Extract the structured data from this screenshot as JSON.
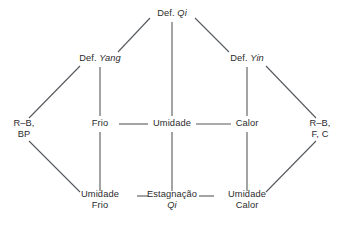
{
  "diagram": {
    "colors": {
      "line": "#55585c",
      "text": "#2b2b2d",
      "background": "#ffffff"
    },
    "nodes": [
      {
        "id": "def-qi",
        "line1_plain": "Def. ",
        "line1_italic": "Qi",
        "line2_plain": "",
        "line2_italic": "",
        "x": 172,
        "y": 14
      },
      {
        "id": "def-yang",
        "line1_plain": "Def. ",
        "line1_italic": "Yang",
        "line2_plain": "",
        "line2_italic": "",
        "x": 100,
        "y": 59
      },
      {
        "id": "def-yin",
        "line1_plain": "Def. ",
        "line1_italic": "Yin",
        "line2_plain": "",
        "line2_italic": "",
        "x": 247,
        "y": 59
      },
      {
        "id": "r-b-bp",
        "line1_plain": "R–B,",
        "line1_italic": "",
        "line2_plain": "BP",
        "line2_italic": "",
        "x": 24,
        "y": 129
      },
      {
        "id": "frio",
        "line1_plain": "Frio",
        "line1_italic": "",
        "line2_plain": "",
        "line2_italic": "",
        "x": 100,
        "y": 124
      },
      {
        "id": "umidade",
        "line1_plain": "Umidade",
        "line1_italic": "",
        "line2_plain": "",
        "line2_italic": "",
        "x": 172,
        "y": 124
      },
      {
        "id": "calor",
        "line1_plain": "Calor",
        "line1_italic": "",
        "line2_plain": "",
        "line2_italic": "",
        "x": 247,
        "y": 124
      },
      {
        "id": "r-b-f-c",
        "line1_plain": "R–B,",
        "line1_italic": "",
        "line2_plain": "F, C",
        "line2_italic": "",
        "x": 320,
        "y": 129
      },
      {
        "id": "umidade-frio",
        "line1_plain": "Umidade",
        "line1_italic": "",
        "line2_plain": "Frio",
        "line2_italic": "",
        "x": 100,
        "y": 200
      },
      {
        "id": "estagnacao-qi",
        "line1_plain": "Estagnação",
        "line1_italic": "",
        "line2_plain": "",
        "line2_italic": "Qi",
        "x": 172,
        "y": 200
      },
      {
        "id": "umidade-calor",
        "line1_plain": "Umidade",
        "line1_italic": "",
        "line2_plain": "Calor",
        "line2_italic": "",
        "x": 247,
        "y": 200
      }
    ],
    "edges": [
      {
        "id": "def-qi--def-yang",
        "from": "def-qi",
        "to": "def-yang",
        "x1": 150,
        "y1": 18,
        "x2": 118,
        "y2": 52
      },
      {
        "id": "def-qi--def-yin",
        "from": "def-qi",
        "to": "def-yin",
        "x1": 195,
        "y1": 18,
        "x2": 229,
        "y2": 52
      },
      {
        "id": "def-qi--umidade",
        "from": "def-qi",
        "to": "umidade",
        "x1": 172,
        "y1": 22,
        "x2": 172,
        "y2": 116
      },
      {
        "id": "def-yang--r-b-bp",
        "from": "def-yang",
        "to": "r-b-bp",
        "x1": 80,
        "y1": 66,
        "x2": 29,
        "y2": 118
      },
      {
        "id": "def-yang--frio",
        "from": "def-yang",
        "to": "frio",
        "x1": 100,
        "y1": 67,
        "x2": 100,
        "y2": 116
      },
      {
        "id": "def-yin--calor",
        "from": "def-yin",
        "to": "calor",
        "x1": 247,
        "y1": 67,
        "x2": 247,
        "y2": 116
      },
      {
        "id": "def-yin--r-b-f-c",
        "from": "def-yin",
        "to": "r-b-f-c",
        "x1": 266,
        "y1": 66,
        "x2": 316,
        "y2": 118
      },
      {
        "id": "frio--umidade",
        "from": "frio",
        "to": "umidade",
        "x1": 119,
        "y1": 124,
        "x2": 148,
        "y2": 124
      },
      {
        "id": "umidade--calor",
        "from": "umidade",
        "to": "calor",
        "x1": 196,
        "y1": 124,
        "x2": 231,
        "y2": 124
      },
      {
        "id": "frio--umidade-frio",
        "from": "frio",
        "to": "umidade-frio",
        "x1": 100,
        "y1": 132,
        "x2": 100,
        "y2": 191
      },
      {
        "id": "umidade--estagnacao-qi",
        "from": "umidade",
        "to": "estagnacao-qi",
        "x1": 172,
        "y1": 132,
        "x2": 172,
        "y2": 191
      },
      {
        "id": "calor--umidade-calor",
        "from": "calor",
        "to": "umidade-calor",
        "x1": 247,
        "y1": 132,
        "x2": 247,
        "y2": 191
      },
      {
        "id": "r-b-bp--umidade-frio",
        "from": "r-b-bp",
        "to": "umidade-frio",
        "x1": 29,
        "y1": 141,
        "x2": 80,
        "y2": 192
      },
      {
        "id": "r-b-f-c--umidade-calor",
        "from": "r-b-f-c",
        "to": "umidade-calor",
        "x1": 316,
        "y1": 141,
        "x2": 266,
        "y2": 192
      },
      {
        "id": "umidade-frio--estagnacao-qi",
        "from": "umidade-frio",
        "to": "estagnacao-qi",
        "x1": 137,
        "y1": 196,
        "x2": 148,
        "y2": 196
      },
      {
        "id": "estagnacao-qi--umidade-calor",
        "from": "estagnacao-qi",
        "to": "umidade-calor",
        "x1": 199,
        "y1": 196,
        "x2": 214,
        "y2": 196
      }
    ]
  }
}
